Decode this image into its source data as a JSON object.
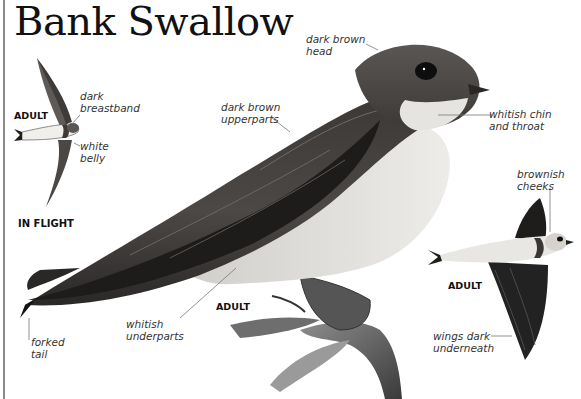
{
  "page": {
    "title": "Bank Swallow"
  },
  "in_flight_panel": {
    "age_tag": "ADULT",
    "caption": "IN FLIGHT",
    "labels": {
      "breastband": "dark\nbreastband",
      "belly": "white\nbelly"
    }
  },
  "main_bird": {
    "age_tag": "ADULT",
    "labels": {
      "head": "dark brown\nhead",
      "upperparts": "dark brown\nupperparts",
      "chin": "whitish chin\nand throat",
      "underparts": "whitish\nunderparts",
      "tail": "forked\ntail"
    }
  },
  "flight_bird_right": {
    "age_tag": "ADULT",
    "labels": {
      "cheeks": "brownish\ncheeks",
      "wings": "wings dark\nunderneath"
    }
  },
  "colors": {
    "text": "#111111",
    "label_text": "#333333",
    "leader_line": "#777777",
    "bird_dark": "#1e1c1b",
    "bird_mid": "#4a4644",
    "bird_light": "#e4e2de",
    "rule": "#8a8a8a"
  }
}
